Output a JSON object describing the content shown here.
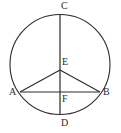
{
  "figure": {
    "type": "geometry-diagram",
    "background_color": "#ffffff",
    "stroke_color": "#2b2b2b",
    "label_color": "#2b2b2b",
    "circle": {
      "center_x": 60,
      "center_y": 64.5,
      "radius": 50
    },
    "points": [
      {
        "name": "C",
        "label": "C",
        "x": 60,
        "y": 14.5
      },
      {
        "name": "E",
        "label": "E",
        "x": 60,
        "y": 70
      },
      {
        "name": "A",
        "label": "A",
        "x": 20,
        "y": 92
      },
      {
        "name": "B",
        "label": "B",
        "x": 100,
        "y": 92
      },
      {
        "name": "F",
        "label": "F",
        "x": 60,
        "y": 92
      },
      {
        "name": "D",
        "label": "D",
        "x": 60,
        "y": 114.5
      }
    ],
    "segments": [
      {
        "name": "diameter-CD",
        "from": "C",
        "to": "D"
      },
      {
        "name": "chord-AB",
        "from": "A",
        "to": "B"
      },
      {
        "name": "side-AE",
        "from": "A",
        "to": "E"
      },
      {
        "name": "side-EB",
        "from": "E",
        "to": "B"
      }
    ]
  }
}
